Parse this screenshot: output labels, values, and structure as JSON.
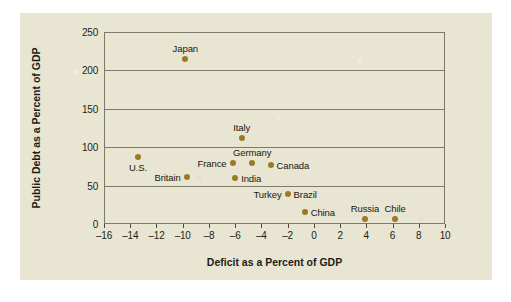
{
  "chart_data": {
    "type": "scatter",
    "title": "",
    "xlabel": "Deficit as a Percent of GDP",
    "ylabel": "Public Debt as a Percent of GDP",
    "xlim": [
      -16,
      10
    ],
    "ylim": [
      0,
      250
    ],
    "xticks": [
      -16,
      -14,
      -12,
      -10,
      -8,
      -6,
      -4,
      -2,
      0,
      2,
      4,
      6,
      8,
      10
    ],
    "xtick_labels": [
      "–16",
      "–14",
      "–12",
      "–10",
      "–8",
      "–6",
      "–4",
      "–2",
      "0",
      "2",
      "4",
      "6",
      "8",
      "10"
    ],
    "yticks": [
      0,
      50,
      100,
      150,
      200,
      250
    ],
    "ytick_labels": [
      "0",
      "50",
      "100",
      "150",
      "200",
      "250"
    ],
    "grid": "horizontal",
    "legend": "none",
    "point_color": "#9a7a26",
    "points": [
      {
        "label": "Japan",
        "x": -9.8,
        "y": 215,
        "label_pos": "above"
      },
      {
        "label": "U.S.",
        "x": -13.4,
        "y": 87,
        "label_pos": "below"
      },
      {
        "label": "Italy",
        "x": -5.5,
        "y": 112,
        "label_pos": "above"
      },
      {
        "label": "Germany",
        "x": -4.7,
        "y": 79,
        "label_pos": "above"
      },
      {
        "label": "France",
        "x": -6.2,
        "y": 79,
        "label_pos": "left"
      },
      {
        "label": "Canada",
        "x": -3.3,
        "y": 77,
        "label_pos": "right"
      },
      {
        "label": "Britain",
        "x": -9.7,
        "y": 61,
        "label_pos": "left"
      },
      {
        "label": "India",
        "x": -6.0,
        "y": 60,
        "label_pos": "right"
      },
      {
        "label": "Brazil",
        "x": -2.0,
        "y": 39,
        "label_pos": "right"
      },
      {
        "label": "Turkey",
        "x": -2.0,
        "y": 39,
        "label_pos": "left"
      },
      {
        "label": "China",
        "x": -0.7,
        "y": 16,
        "label_pos": "right"
      },
      {
        "label": "Russia",
        "x": 3.9,
        "y": 7,
        "label_pos": "above"
      },
      {
        "label": "Chile",
        "x": 6.2,
        "y": 7,
        "label_pos": "above"
      }
    ]
  }
}
